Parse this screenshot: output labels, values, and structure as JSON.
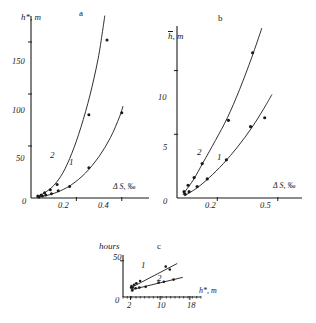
{
  "figure": {
    "background": "#ffffff",
    "ink": "#1a1a1a"
  },
  "chart_data": [
    {
      "id": "panel-a",
      "type": "scatter",
      "panel_label": "a",
      "title": "",
      "xlabel": "Δ S, ‰",
      "ylabel": "h*, m",
      "xlim": [
        0,
        0.52
      ],
      "ylim": [
        0,
        175
      ],
      "xticks": [
        0,
        0.2,
        0.4
      ],
      "xtick_labels": [
        "0",
        "0.2",
        "0.4"
      ],
      "yticks": [
        0,
        50,
        100,
        150
      ],
      "ytick_labels": [
        "0",
        "50",
        "100",
        "150"
      ],
      "grid": false,
      "legend": "inline-curve-labels",
      "series": [
        {
          "name": "1",
          "label": "1",
          "marker": "filled-circle",
          "points": [
            {
              "x": 0.035,
              "y": 1
            },
            {
              "x": 0.05,
              "y": 2
            },
            {
              "x": 0.065,
              "y": 3
            },
            {
              "x": 0.09,
              "y": 4
            },
            {
              "x": 0.12,
              "y": 7
            },
            {
              "x": 0.17,
              "y": 11
            },
            {
              "x": 0.255,
              "y": 29
            },
            {
              "x": 0.4,
              "y": 82
            }
          ],
          "curve": [
            {
              "x": 0.03,
              "y": 1
            },
            {
              "x": 0.08,
              "y": 3
            },
            {
              "x": 0.13,
              "y": 7
            },
            {
              "x": 0.18,
              "y": 13
            },
            {
              "x": 0.24,
              "y": 24
            },
            {
              "x": 0.3,
              "y": 40
            },
            {
              "x": 0.35,
              "y": 58
            },
            {
              "x": 0.39,
              "y": 78
            },
            {
              "x": 0.405,
              "y": 88
            }
          ]
        },
        {
          "name": "2",
          "label": "2",
          "marker": "filled-circle",
          "points": [
            {
              "x": 0.03,
              "y": 2
            },
            {
              "x": 0.045,
              "y": 3
            },
            {
              "x": 0.06,
              "y": 5
            },
            {
              "x": 0.085,
              "y": 8
            },
            {
              "x": 0.115,
              "y": 13
            },
            {
              "x": 0.255,
              "y": 80
            },
            {
              "x": 0.335,
              "y": 152
            }
          ],
          "curve": [
            {
              "x": 0.025,
              "y": 1
            },
            {
              "x": 0.06,
              "y": 5
            },
            {
              "x": 0.1,
              "y": 12
            },
            {
              "x": 0.14,
              "y": 24
            },
            {
              "x": 0.18,
              "y": 43
            },
            {
              "x": 0.22,
              "y": 68
            },
            {
              "x": 0.26,
              "y": 99
            },
            {
              "x": 0.295,
              "y": 133
            },
            {
              "x": 0.315,
              "y": 160
            },
            {
              "x": 0.325,
              "y": 175
            }
          ]
        }
      ]
    },
    {
      "id": "panel-b",
      "type": "scatter",
      "panel_label": "b",
      "title": "",
      "xlabel": "Δ S, ‰",
      "ylabel": "h̄, m",
      "xlim": [
        0,
        0.62
      ],
      "ylim": [
        0,
        13.5
      ],
      "xticks": [
        0,
        0.2,
        0.5
      ],
      "xtick_labels": [
        "0",
        "0.2",
        "0.5"
      ],
      "yticks": [
        0,
        5,
        10
      ],
      "ytick_labels": [
        "0",
        "5",
        "10"
      ],
      "grid": false,
      "legend": "inline-curve-labels",
      "series": [
        {
          "name": "1",
          "label": "1",
          "marker": "filled-circle",
          "points": [
            {
              "x": 0.04,
              "y": 0.3
            },
            {
              "x": 0.06,
              "y": 0.5
            },
            {
              "x": 0.1,
              "y": 0.9
            },
            {
              "x": 0.15,
              "y": 1.5
            },
            {
              "x": 0.245,
              "y": 3.0
            },
            {
              "x": 0.365,
              "y": 5.6
            },
            {
              "x": 0.435,
              "y": 6.3
            }
          ],
          "curve": [
            {
              "x": 0.04,
              "y": 0.2
            },
            {
              "x": 0.1,
              "y": 0.8
            },
            {
              "x": 0.16,
              "y": 1.6
            },
            {
              "x": 0.23,
              "y": 2.7
            },
            {
              "x": 0.3,
              "y": 4.0
            },
            {
              "x": 0.37,
              "y": 5.5
            },
            {
              "x": 0.43,
              "y": 7.0
            },
            {
              "x": 0.47,
              "y": 8.1
            }
          ]
        },
        {
          "name": "2",
          "label": "2",
          "marker": "filled-circle",
          "points": [
            {
              "x": 0.035,
              "y": 0.5
            },
            {
              "x": 0.055,
              "y": 1.0
            },
            {
              "x": 0.085,
              "y": 1.6
            },
            {
              "x": 0.125,
              "y": 2.7
            },
            {
              "x": 0.255,
              "y": 6.1
            },
            {
              "x": 0.375,
              "y": 11.4
            }
          ],
          "curve": [
            {
              "x": 0.03,
              "y": 0.3
            },
            {
              "x": 0.08,
              "y": 1.4
            },
            {
              "x": 0.13,
              "y": 2.8
            },
            {
              "x": 0.19,
              "y": 4.5
            },
            {
              "x": 0.25,
              "y": 6.3
            },
            {
              "x": 0.31,
              "y": 8.5
            },
            {
              "x": 0.37,
              "y": 11.0
            },
            {
              "x": 0.42,
              "y": 13.3
            }
          ]
        }
      ]
    },
    {
      "id": "panel-c",
      "type": "scatter",
      "panel_label": "c",
      "title": "hours",
      "xlabel": "h*, m",
      "ylabel": "hours",
      "xlim": [
        0,
        21
      ],
      "ylim": [
        0,
        58
      ],
      "xticks": [
        2,
        10,
        18
      ],
      "xtick_labels": [
        "2",
        "10",
        "18"
      ],
      "yticks": [
        0,
        50
      ],
      "ytick_labels": [
        "0",
        "50"
      ],
      "grid": false,
      "legend": "inline-curve-labels",
      "series": [
        {
          "name": "1",
          "label": "1",
          "marker": "filled-circle",
          "points": [
            {
              "x": 2.3,
              "y": 15
            },
            {
              "x": 2.6,
              "y": 13
            },
            {
              "x": 3.0,
              "y": 17
            },
            {
              "x": 3.6,
              "y": 19
            },
            {
              "x": 4.6,
              "y": 22
            },
            {
              "x": 11.5,
              "y": 42
            },
            {
              "x": 12.6,
              "y": 38
            }
          ],
          "curve": [
            {
              "x": 2.2,
              "y": 13
            },
            {
              "x": 14.5,
              "y": 46
            }
          ]
        },
        {
          "name": "2",
          "label": "2",
          "marker": "filled-circle",
          "points": [
            {
              "x": 2.2,
              "y": 13
            },
            {
              "x": 2.5,
              "y": 9
            },
            {
              "x": 3.4,
              "y": 12
            },
            {
              "x": 4.4,
              "y": 13
            },
            {
              "x": 6.1,
              "y": 14
            },
            {
              "x": 9.6,
              "y": 20
            },
            {
              "x": 11.0,
              "y": 21
            },
            {
              "x": 13.6,
              "y": 24
            }
          ],
          "curve": [
            {
              "x": 2.2,
              "y": 10
            },
            {
              "x": 16.0,
              "y": 27
            }
          ]
        }
      ]
    }
  ]
}
